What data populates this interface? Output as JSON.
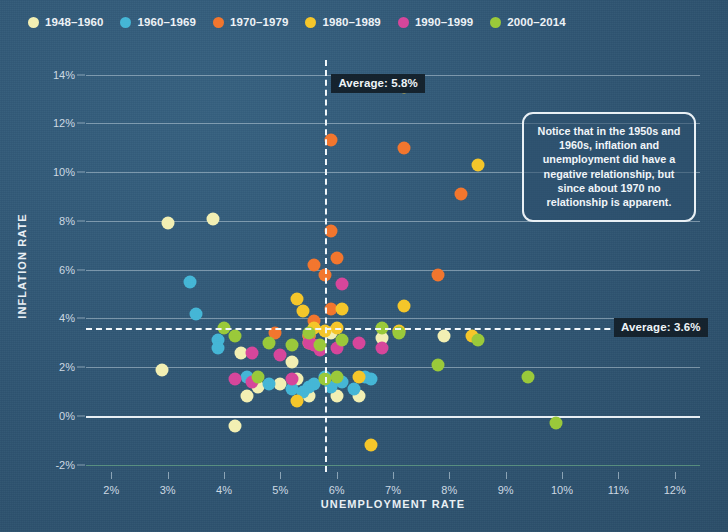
{
  "legend": {
    "items": [
      {
        "label": "1948–1960",
        "color": "#f2efb3"
      },
      {
        "label": "1960–1969",
        "color": "#45b6d6"
      },
      {
        "label": "1970–1979",
        "color": "#f2762e"
      },
      {
        "label": "1980–1989",
        "color": "#f5c62a"
      },
      {
        "label": "1990–1999",
        "color": "#d6469b"
      },
      {
        "label": "2000–2014",
        "color": "#9ac93a"
      }
    ]
  },
  "annotation": {
    "text": "Notice that in the 1950s and 1960s, inflation and unemployment did have a negative relationship, but since about 1970 no relationship is apparent."
  },
  "averages": {
    "unemployment_label": "Average: 5.8%",
    "unemployment_value": 5.8,
    "inflation_label": "Average: 3.6%",
    "inflation_value": 3.6
  },
  "chart_data": {
    "type": "scatter",
    "title": "",
    "xlabel": "UNEMPLOYMENT RATE",
    "ylabel": "INFLATION RATE",
    "xlim": [
      1.55,
      12.45
    ],
    "ylim": [
      -2.3,
      14.6
    ],
    "xticks": [
      "2%",
      "3%",
      "4%",
      "5%",
      "6%",
      "7%",
      "8%",
      "9%",
      "10%",
      "11%",
      "12%"
    ],
    "xtick_values": [
      2,
      3,
      4,
      5,
      6,
      7,
      8,
      9,
      10,
      11,
      12
    ],
    "yticks": [
      "-2%",
      "0%",
      "2%",
      "4%",
      "6%",
      "8%",
      "10%",
      "12%",
      "14%"
    ],
    "ytick_values": [
      -2,
      0,
      2,
      4,
      6,
      8,
      10,
      12,
      14
    ],
    "grid": "horizontal",
    "legend_position": "top-left",
    "series": [
      {
        "name": "1948–1960",
        "color": "#f2efb3",
        "points": [
          [
            3.8,
            8.1
          ],
          [
            3.0,
            7.9
          ],
          [
            2.9,
            1.9
          ],
          [
            4.3,
            2.6
          ],
          [
            4.4,
            0.8
          ],
          [
            5.3,
            1.5
          ],
          [
            5.5,
            0.8
          ],
          [
            5.5,
            3.3
          ],
          [
            4.2,
            -0.4
          ],
          [
            6.0,
            0.8
          ],
          [
            6.4,
            0.8
          ],
          [
            6.8,
            3.2
          ],
          [
            5.9,
            3.4
          ],
          [
            5.0,
            1.3
          ],
          [
            4.6,
            1.2
          ],
          [
            5.2,
            2.2
          ],
          [
            7.9,
            3.3
          ]
        ]
      },
      {
        "name": "1960–1969",
        "color": "#45b6d6",
        "points": [
          [
            3.4,
            5.5
          ],
          [
            3.5,
            4.2
          ],
          [
            3.9,
            3.1
          ],
          [
            3.9,
            2.8
          ],
          [
            4.4,
            1.6
          ],
          [
            4.8,
            1.3
          ],
          [
            5.2,
            1.1
          ],
          [
            5.5,
            1.2
          ],
          [
            5.6,
            1.3
          ],
          [
            5.9,
            1.2
          ],
          [
            6.1,
            1.4
          ],
          [
            6.5,
            1.6
          ],
          [
            5.8,
            1.6
          ],
          [
            5.4,
            1.0
          ],
          [
            6.6,
            1.5
          ],
          [
            6.3,
            1.1
          ]
        ]
      },
      {
        "name": "1970–1979",
        "color": "#f2762e",
        "points": [
          [
            5.9,
            11.3
          ],
          [
            7.2,
            11.0
          ],
          [
            8.2,
            9.1
          ],
          [
            5.9,
            7.6
          ],
          [
            5.6,
            6.2
          ],
          [
            6.0,
            6.5
          ],
          [
            5.8,
            5.8
          ],
          [
            7.8,
            5.8
          ],
          [
            5.9,
            4.4
          ],
          [
            5.6,
            3.9
          ],
          [
            4.9,
            3.4
          ],
          [
            5.5,
            3.3
          ]
        ]
      },
      {
        "name": "1980–1989",
        "color": "#f5c62a",
        "points": [
          [
            7.2,
            13.5
          ],
          [
            8.5,
            10.3
          ],
          [
            5.3,
            4.8
          ],
          [
            5.4,
            4.3
          ],
          [
            6.1,
            4.4
          ],
          [
            7.2,
            4.5
          ],
          [
            5.6,
            3.6
          ],
          [
            6.0,
            3.6
          ],
          [
            7.1,
            3.5
          ],
          [
            8.4,
            3.3
          ],
          [
            5.8,
            3.5
          ],
          [
            5.5,
            3.0
          ],
          [
            6.4,
            1.6
          ],
          [
            5.3,
            0.6
          ],
          [
            6.6,
            -1.2
          ]
        ]
      },
      {
        "name": "1990–1999",
        "color": "#d6469b",
        "points": [
          [
            6.1,
            5.4
          ],
          [
            5.5,
            3.0
          ],
          [
            5.6,
            2.9
          ],
          [
            5.7,
            2.8
          ],
          [
            5.7,
            2.7
          ],
          [
            6.0,
            2.8
          ],
          [
            6.4,
            3.0
          ],
          [
            6.8,
            2.8
          ],
          [
            4.5,
            2.6
          ],
          [
            5.0,
            2.5
          ],
          [
            4.5,
            1.4
          ],
          [
            4.2,
            1.5
          ],
          [
            5.2,
            1.5
          ]
        ]
      },
      {
        "name": "2000–2014",
        "color": "#9ac93a",
        "points": [
          [
            4.0,
            3.6
          ],
          [
            4.2,
            3.3
          ],
          [
            4.8,
            3.0
          ],
          [
            5.5,
            3.4
          ],
          [
            5.7,
            2.9
          ],
          [
            6.1,
            3.1
          ],
          [
            6.8,
            3.6
          ],
          [
            7.1,
            3.4
          ],
          [
            7.8,
            2.1
          ],
          [
            8.5,
            3.1
          ],
          [
            9.4,
            1.6
          ],
          [
            9.9,
            -0.3
          ],
          [
            5.2,
            2.9
          ],
          [
            5.8,
            1.5
          ],
          [
            6.0,
            1.6
          ],
          [
            4.6,
            1.6
          ]
        ]
      }
    ]
  }
}
